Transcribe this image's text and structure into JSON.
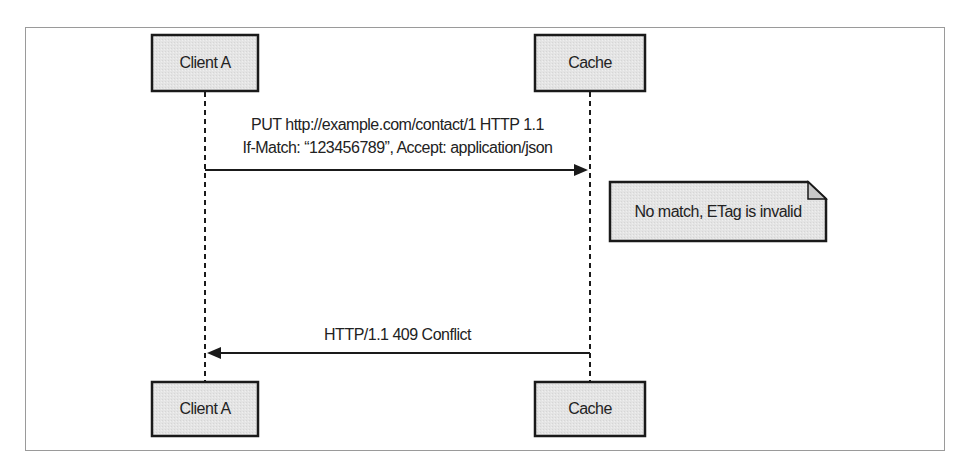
{
  "diagram": {
    "type": "sequence",
    "participants": [
      {
        "id": "client",
        "label": "Client A"
      },
      {
        "id": "cache",
        "label": "Cache"
      }
    ],
    "messages": [
      {
        "from": "client",
        "to": "cache",
        "line1": "PUT http://example.com/contact/1 HTTP 1.1",
        "line2": "If-Match: “123456789”, Accept: application/json"
      },
      {
        "from": "cache",
        "to": "client",
        "line1": "HTTP/1.1 409 Conflict"
      }
    ],
    "note": {
      "on": "cache",
      "text": "No match, ETag is invalid"
    }
  },
  "colors": {
    "box_fill": "#e6e6e6",
    "stroke": "#1a1a1a",
    "frame": "#9a9a9a"
  }
}
